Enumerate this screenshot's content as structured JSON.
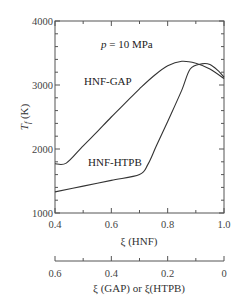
{
  "chart_data": {
    "type": "line",
    "title": "",
    "annotation": "p = 10 MPa",
    "xlabel": "ξ (HNF)",
    "xlabel_secondary": "ξ (GAP)  or  ξ(HTPB)",
    "ylabel": "Tf (K)",
    "xlim": [
      0.4,
      1.0
    ],
    "ylim": [
      1000,
      4000
    ],
    "grid": false,
    "legend_position": "inline labels",
    "x_ticks": [
      "0.4",
      "0.6",
      "0.8",
      "1.0"
    ],
    "x_secondary_ticks": [
      "0.6",
      "0.4",
      "0.2",
      "0"
    ],
    "y_ticks": [
      "1000",
      "2000",
      "3000",
      "4000"
    ],
    "series": [
      {
        "name": "HNF-GAP",
        "x": [
          0.4,
          0.44,
          0.5,
          0.55,
          0.6,
          0.65,
          0.7,
          0.75,
          0.8,
          0.85,
          0.9,
          0.95,
          1.0
        ],
        "y": [
          1770,
          1780,
          2050,
          2270,
          2500,
          2720,
          2940,
          3140,
          3300,
          3370,
          3340,
          3250,
          3100
        ]
      },
      {
        "name": "HNF-HTPB",
        "x": [
          0.4,
          0.5,
          0.6,
          0.7,
          0.73,
          0.76,
          0.8,
          0.85,
          0.88,
          0.92,
          0.95,
          0.98,
          1.0
        ],
        "y": [
          1330,
          1420,
          1510,
          1600,
          1760,
          2050,
          2430,
          2920,
          3250,
          3330,
          3320,
          3220,
          3120
        ]
      }
    ]
  },
  "labels": {
    "pressure": "p = 10 MPa",
    "series_gap": "HNF-GAP",
    "series_htpb": "HNF-HTPB",
    "y_axis": "Tf (K)",
    "x_axis": "ξ (HNF)",
    "x_axis_secondary": "ξ (GAP)  or  ξ(HTPB)"
  }
}
